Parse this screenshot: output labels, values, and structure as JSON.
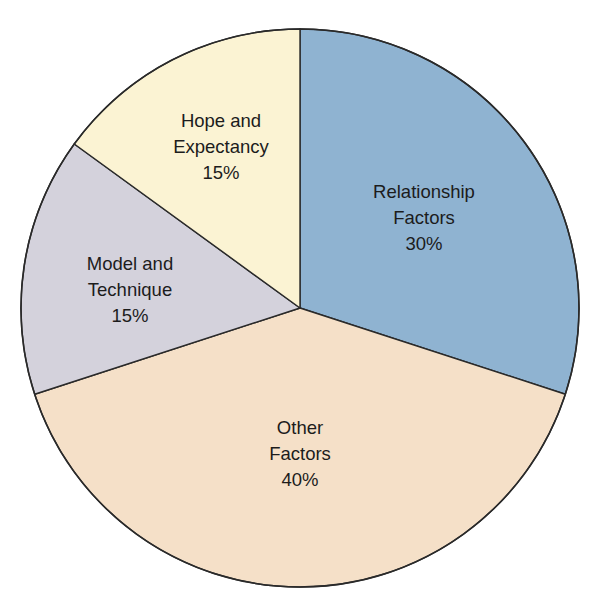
{
  "chart_data": {
    "type": "pie",
    "title": "",
    "start_angle_deg": 0,
    "direction": "clockwise",
    "center": [
      300,
      308
    ],
    "radius": 279,
    "slices": [
      {
        "name": "Relationship Factors",
        "label_lines": [
          "Relationship",
          "Factors",
          "30%"
        ],
        "value": 30,
        "color": "#8fb3d1",
        "label_pos": [
          424,
          192
        ]
      },
      {
        "name": "Other Factors",
        "label_lines": [
          "Other",
          "Factors",
          "40%"
        ],
        "value": 40,
        "color": "#f5e0c8",
        "label_pos": [
          300,
          428
        ]
      },
      {
        "name": "Model and Technique",
        "label_lines": [
          "Model and",
          "Technique",
          "15%"
        ],
        "value": 15,
        "color": "#d4d2dc",
        "label_pos": [
          130,
          264
        ]
      },
      {
        "name": "Hope and Expectancy",
        "label_lines": [
          "Hope and",
          "Expectancy",
          "15%"
        ],
        "value": 15,
        "color": "#fbf3d3",
        "label_pos": [
          221,
          121
        ]
      }
    ],
    "categories": [
      "Relationship Factors",
      "Other Factors",
      "Model and Technique",
      "Hope and Expectancy"
    ],
    "values": [
      30,
      40,
      15,
      15
    ],
    "legend": "none (labels inside slices)"
  }
}
